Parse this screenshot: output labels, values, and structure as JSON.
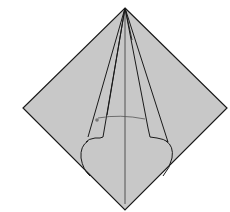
{
  "diagram": {
    "colors": {
      "paper": "#c8c8c8",
      "line": "#1a1a1a",
      "background": "#ffffff"
    },
    "elements": {
      "paper_label": "paper",
      "center_crease_label": "center crease",
      "left_flap_label": "left flap",
      "right_flap_label": "right flap",
      "arrow_label": "fold arrow"
    }
  }
}
